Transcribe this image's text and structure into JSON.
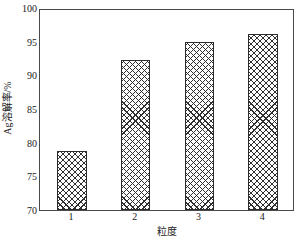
{
  "chart_data": {
    "type": "bar",
    "title": "",
    "subtitle": "",
    "xlabel": "粒度",
    "ylabel": "Ag溶解率/%",
    "categories": [
      "1",
      "2",
      "3",
      "4"
    ],
    "values": [
      78.8,
      92.3,
      95.0,
      96.1
    ],
    "series": [
      {
        "name": "Ag溶解率",
        "values": [
          78.8,
          92.3,
          95.0,
          96.1
        ]
      }
    ],
    "ylim": [
      70,
      100
    ],
    "yticks": [
      70,
      75,
      80,
      85,
      90,
      95,
      100
    ],
    "ytick_labels": [
      "70",
      "75",
      "80",
      "85",
      "90",
      "95",
      "100"
    ],
    "xtick_labels": [
      "1",
      "2",
      "3",
      "4"
    ],
    "grid": false,
    "legend": false,
    "legend_position": "none",
    "bar_fill": "crosshatch",
    "bar_edge_color": "#2b2b2b",
    "bar_pattern_color": "#2f2f2f",
    "background_color": "#ffffff",
    "axis_color": "#4a4a4a",
    "frame": "box"
  }
}
